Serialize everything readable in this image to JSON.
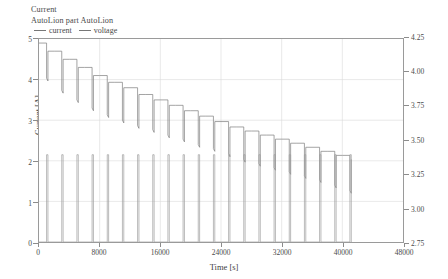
{
  "title": {
    "line1": "Current",
    "line2": "AutoLion part AutoLion"
  },
  "legend": {
    "items": [
      {
        "label": "current",
        "color": "#8a8a8a"
      },
      {
        "label": "voltage",
        "color": "#8a8a8a"
      }
    ]
  },
  "axes": {
    "x": {
      "label": "Time [s]",
      "ticks": [
        "0",
        "8000",
        "16000",
        "24000",
        "32000",
        "40000",
        "48000"
      ],
      "min": 0,
      "max": 48000
    },
    "y_left": {
      "label": "Current [A]",
      "ticks": [
        "0",
        "1",
        "2",
        "3",
        "4",
        "5"
      ],
      "min": 0,
      "max": 5
    },
    "y_right": {
      "label": "Terminal Voltage [V]",
      "ticks": [
        "2.75",
        "3.00",
        "3.25",
        "3.50",
        "3.75",
        "4.00",
        "4.25"
      ],
      "min": 2.75,
      "max": 4.25
    }
  },
  "chart_data": {
    "type": "line",
    "title": "Current",
    "subtitle": "AutoLion part AutoLion",
    "xlabel": "Time [s]",
    "ylabel": "Current [A]",
    "ylabel_right": "Terminal Voltage [V]",
    "xlim": [
      0,
      48000
    ],
    "ylim": [
      0,
      5
    ],
    "ylim_right": [
      2.75,
      4.25
    ],
    "grid": true,
    "legend_position": "top-left",
    "series": [
      {
        "name": "current",
        "axis": "left",
        "units": "A",
        "pulse_amplitude": 2.15,
        "baseline": 0.0,
        "pulse_width": 180,
        "pulse_period": 2000,
        "pulse_start_times": [
          1000,
          3000,
          5000,
          7000,
          9000,
          11000,
          13000,
          15000,
          17000,
          19000,
          21000,
          23000,
          25000,
          27000,
          29000,
          31000,
          33000,
          35000,
          37000,
          39000,
          41000
        ],
        "end_time": 41200
      },
      {
        "name": "voltage",
        "axis": "right",
        "units": "V",
        "rest_plateau_voltages": [
          4.22,
          4.16,
          4.1,
          4.04,
          3.98,
          3.93,
          3.89,
          3.84,
          3.8,
          3.76,
          3.72,
          3.68,
          3.64,
          3.6,
          3.57,
          3.54,
          3.51,
          3.48,
          3.45,
          3.42,
          3.39
        ],
        "pulse_dip_voltages": [
          3.96,
          3.87,
          3.8,
          3.74,
          3.69,
          3.65,
          3.61,
          3.58,
          3.54,
          3.51,
          3.47,
          3.44,
          3.4,
          3.36,
          3.33,
          3.3,
          3.27,
          3.24,
          3.21,
          3.17,
          3.13
        ],
        "plateau_start_times": [
          0,
          2000,
          4000,
          6000,
          8000,
          10000,
          12000,
          14000,
          16000,
          18000,
          20000,
          22000,
          24000,
          26000,
          28000,
          30000,
          32000,
          34000,
          36000,
          38000,
          40000
        ],
        "end_time": 41200,
        "start_voltage": 4.22,
        "end_voltage": 3.39
      }
    ]
  },
  "colors": {
    "line": "#7d7d7d",
    "frame": "#9a9a9a",
    "grid": "#dadada",
    "text": "#3f3f3f",
    "background": "#ffffff"
  }
}
